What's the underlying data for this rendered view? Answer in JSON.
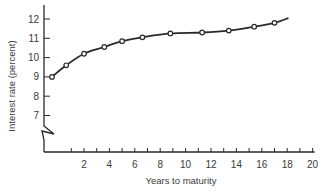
{
  "chart_data": {
    "type": "line",
    "title": "",
    "xlabel": "Years to maturity",
    "ylabel": "Interest rate (percent)",
    "xlim": [
      0,
      20
    ],
    "ylim": [
      7,
      12
    ],
    "x_ticks": [
      2,
      4,
      6,
      8,
      10,
      12,
      14,
      16,
      18,
      20
    ],
    "x_minor_tick_step": 1,
    "y_ticks": [
      7,
      8,
      9,
      10,
      11,
      12
    ],
    "y_axis_break": true,
    "grid": false,
    "legend": null,
    "series": [
      {
        "name": "Yield curve",
        "marker": "open-circle",
        "points": [
          {
            "x": 0.25,
            "y": 9.0
          },
          {
            "x": 0.6,
            "y": 9.6
          },
          {
            "x": 2.0,
            "y": 10.2
          },
          {
            "x": 3.6,
            "y": 10.55
          },
          {
            "x": 5.0,
            "y": 10.85
          },
          {
            "x": 6.6,
            "y": 11.05
          },
          {
            "x": 8.8,
            "y": 11.25
          },
          {
            "x": 11.3,
            "y": 11.3
          },
          {
            "x": 13.4,
            "y": 11.4
          },
          {
            "x": 15.4,
            "y": 11.6
          },
          {
            "x": 17.0,
            "y": 11.8
          }
        ],
        "line_end": {
          "x": 18.1,
          "y": 12.05
        }
      }
    ]
  },
  "colors": {
    "line": "#2a2a2a",
    "axis": "#2a2a2a",
    "text": "#3a3a3a",
    "background": "#ffffff"
  }
}
